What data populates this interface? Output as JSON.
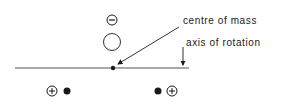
{
  "diagram": {
    "labels": {
      "centre_of_mass": "centre of mass",
      "axis_of_rotation": "axis of rotation"
    },
    "charges": {
      "negative": "−",
      "positive_left": "+",
      "positive_right": "+"
    },
    "colors": {
      "ink": "#1a1a1a",
      "line": "#555555",
      "background": "#ffffff"
    }
  }
}
